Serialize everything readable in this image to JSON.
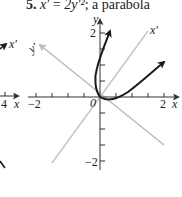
{
  "title": {
    "number": "5.",
    "equation_lhs": "x′",
    "equals": "=",
    "equation_rhs": "2y′²",
    "description": "; a parabola"
  },
  "axes": {
    "x_label": "x",
    "y_label": "y",
    "origin_label": "0",
    "x_tick_labels": [
      "−2",
      "2"
    ],
    "y_tick_labels": [
      "2",
      "−2"
    ]
  },
  "rotated_axes": {
    "x_prime_label": "x′",
    "y_prime_label": "y′"
  },
  "left_fragment": {
    "x_tick_label": "4",
    "x_label": "x",
    "x_prime_label": "x′"
  },
  "colors": {
    "curve": "#1a1a1a",
    "axes": "#333333",
    "rotated_axes": "#bdbdbd"
  }
}
